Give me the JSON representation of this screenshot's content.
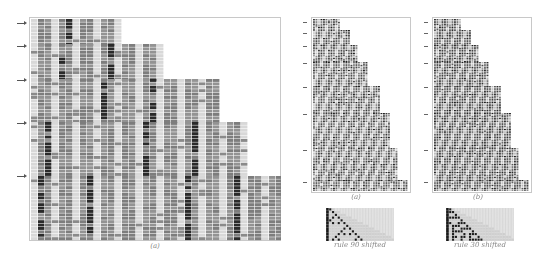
{
  "figure": {
    "panels": [
      {
        "id": "left-a",
        "caption": "(a)",
        "frame": {
          "x": 29,
          "y": 17,
          "w": 252,
          "h": 224
        },
        "caption_pos": {
          "x": 155,
          "y": 247
        },
        "arrows_y": [
          23,
          46,
          80,
          123,
          176
        ],
        "blocks": [
          {
            "y0": 19,
            "y1": 44,
            "x1": 120
          },
          {
            "y0": 44,
            "y1": 79,
            "x1": 162
          },
          {
            "y0": 79,
            "y1": 122,
            "x1": 217
          },
          {
            "y0": 122,
            "y1": 176,
            "x1": 245
          },
          {
            "y0": 176,
            "y1": 238,
            "x1": 277
          }
        ],
        "style": "cells"
      },
      {
        "id": "right-a",
        "caption": "(a)",
        "frame": {
          "x": 311,
          "y": 17,
          "w": 100,
          "h": 176
        },
        "caption_pos": {
          "x": 356,
          "y": 198
        },
        "arrows_y": [
          22,
          33,
          46,
          63,
          87,
          114,
          150,
          182
        ],
        "blocks": [
          {
            "y0": 19,
            "y1": 30,
            "x1": 340
          },
          {
            "y0": 30,
            "y1": 45,
            "x1": 350
          },
          {
            "y0": 45,
            "y1": 62,
            "x1": 358
          },
          {
            "y0": 62,
            "y1": 86,
            "x1": 368
          },
          {
            "y0": 86,
            "y1": 113,
            "x1": 380
          },
          {
            "y0": 113,
            "y1": 148,
            "x1": 390
          },
          {
            "y0": 148,
            "y1": 180,
            "x1": 398
          },
          {
            "y0": 180,
            "y1": 190,
            "x1": 407
          }
        ],
        "style": "dense"
      },
      {
        "id": "right-b",
        "caption": "(b)",
        "frame": {
          "x": 432,
          "y": 17,
          "w": 100,
          "h": 176
        },
        "caption_pos": {
          "x": 478,
          "y": 198
        },
        "arrows_y": [
          22,
          33,
          46,
          63,
          87,
          114,
          150,
          182
        ],
        "blocks": [
          {
            "y0": 19,
            "y1": 30,
            "x1": 461
          },
          {
            "y0": 30,
            "y1": 45,
            "x1": 471
          },
          {
            "y0": 45,
            "y1": 62,
            "x1": 479
          },
          {
            "y0": 62,
            "y1": 86,
            "x1": 489
          },
          {
            "y0": 86,
            "y1": 113,
            "x1": 501
          },
          {
            "y0": 113,
            "y1": 148,
            "x1": 511
          },
          {
            "y0": 148,
            "y1": 180,
            "x1": 519
          },
          {
            "y0": 180,
            "y1": 190,
            "x1": 528
          }
        ],
        "style": "dense-dark"
      }
    ],
    "insets": [
      {
        "id": "rule-90-inset",
        "label": "rule 90 shifted",
        "rule": 90,
        "box": {
          "x": 326,
          "y": 208,
          "w": 68,
          "h": 33
        },
        "label_pos": {
          "x": 360,
          "y": 245
        }
      },
      {
        "id": "rule-30-inset",
        "label": "rule 30 shifted",
        "rule": 30,
        "box": {
          "x": 446,
          "y": 208,
          "w": 68,
          "h": 33
        },
        "label_pos": {
          "x": 480,
          "y": 245
        }
      }
    ],
    "colors": {
      "cell_gray": "#8a8a8a",
      "cell_light": "#d8d8d8",
      "cell_dark": "#2a2a2a",
      "grid_line": "#b0b0b0",
      "frame": "#c8c8c8",
      "caption": "#888888"
    }
  }
}
